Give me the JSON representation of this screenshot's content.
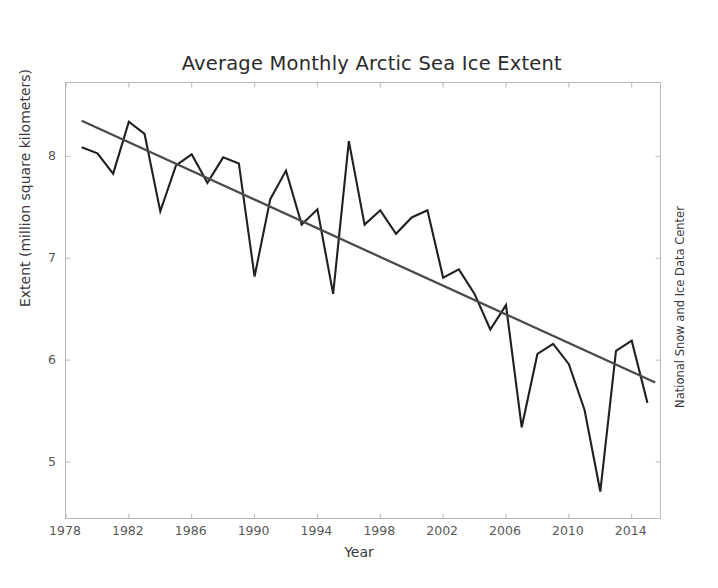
{
  "chart_data": {
    "type": "line",
    "title": "Average Monthly Arctic Sea Ice Extent\nAugust 1979 - 2015",
    "title_line1": "Average Monthly Arctic Sea Ice Extent",
    "title_line2": "August 1979 - 2015",
    "xlabel": "Year",
    "ylabel": "Extent (million square kilometers)",
    "credit": "National Snow and Ice Data Center",
    "xlim": [
      1978,
      2015.8
    ],
    "ylim": [
      4.45,
      8.72
    ],
    "xticks": [
      1978,
      1982,
      1986,
      1990,
      1994,
      1998,
      2002,
      2006,
      2010,
      2014
    ],
    "yticks": [
      5,
      6,
      7,
      8
    ],
    "grid": false,
    "legend": "none",
    "line_color": "#231f20",
    "trend_color": "#4a4a4a",
    "x": [
      1979,
      1980,
      1981,
      1982,
      1983,
      1984,
      1985,
      1986,
      1987,
      1988,
      1989,
      1990,
      1991,
      1992,
      1993,
      1994,
      1995,
      1996,
      1997,
      1998,
      1999,
      2000,
      2001,
      2002,
      2003,
      2004,
      2005,
      2006,
      2007,
      2008,
      2009,
      2010,
      2011,
      2012,
      2013,
      2014,
      2015
    ],
    "series": [
      {
        "name": "August Arctic sea ice extent",
        "values": [
          8.09,
          8.03,
          7.83,
          8.34,
          8.22,
          7.46,
          7.91,
          8.02,
          7.74,
          7.99,
          7.93,
          6.82,
          7.58,
          7.86,
          7.33,
          7.48,
          6.65,
          8.15,
          7.33,
          7.47,
          7.24,
          7.4,
          7.47,
          6.81,
          6.89,
          6.65,
          6.3,
          6.54,
          5.34,
          6.06,
          6.16,
          5.96,
          5.51,
          4.71,
          6.09,
          6.19,
          5.58
        ]
      }
    ],
    "trendline": {
      "name": "Linear trend",
      "x_start": 1979,
      "y_start": 8.35,
      "x_end": 2015.5,
      "y_end": 5.78
    }
  }
}
